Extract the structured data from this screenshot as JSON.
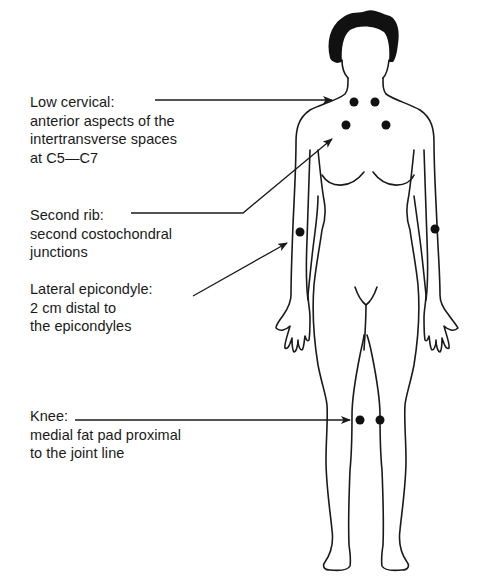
{
  "diagram": {
    "type": "anatomical-tender-points",
    "colors": {
      "line": "#1a1a1a",
      "point": "#111111",
      "hair": "#111111",
      "background": "#ffffff"
    },
    "labels": [
      {
        "id": "low-cervical",
        "title": "Low cervical:",
        "lines": [
          "anterior aspects of the",
          "intertransverse spaces",
          "at C5—C7"
        ]
      },
      {
        "id": "second-rib",
        "title": "Second rib:",
        "lines": [
          "second costochondral",
          "junctions"
        ]
      },
      {
        "id": "lateral-epicondyle",
        "title": "Lateral epicondyle:",
        "lines": [
          "2 cm distal to",
          "the epicondyles"
        ]
      },
      {
        "id": "knee",
        "title": "Knee:",
        "lines": [
          "medial fat pad proximal",
          "to the joint line"
        ]
      }
    ],
    "points": [
      {
        "site": "low-cervical-left",
        "x": 354,
        "y": 102
      },
      {
        "site": "low-cervical-right",
        "x": 375,
        "y": 102
      },
      {
        "site": "second-rib-left",
        "x": 346,
        "y": 125
      },
      {
        "site": "second-rib-right",
        "x": 386,
        "y": 125
      },
      {
        "site": "lateral-epicondyle-left",
        "x": 300,
        "y": 232
      },
      {
        "site": "lateral-epicondyle-right",
        "x": 435,
        "y": 229
      },
      {
        "site": "knee-left",
        "x": 360,
        "y": 420
      },
      {
        "site": "knee-right",
        "x": 380,
        "y": 420
      }
    ]
  }
}
